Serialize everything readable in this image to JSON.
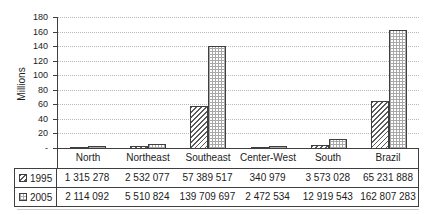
{
  "colors": {
    "background": "#ffffff",
    "axis_and_borders": "#3f3f3f",
    "text": "#1c1c1c",
    "gridline": "#b9b9b9",
    "hatch_pattern_1995": "#5a5a5a",
    "grid_pattern_2005": "#a8a8a8",
    "table_shadow": "#cccccc"
  },
  "chart_data": {
    "type": "bar",
    "title": "",
    "xlabel": "",
    "ylabel": "Millions",
    "categories": [
      "North",
      "Northeast",
      "Southeast",
      "Center-West",
      "South",
      "Brazil"
    ],
    "series": [
      {
        "name": "1995",
        "pattern": "diagonal-hatch",
        "values": [
          1315278,
          2532077,
          57389517,
          340979,
          3573028,
          65231888
        ],
        "value_labels": [
          "1 315 278",
          "2 532 077",
          "57 389 517",
          "340 979",
          "3 573 028",
          "65 231 888"
        ]
      },
      {
        "name": "2005",
        "pattern": "fine-grid",
        "values": [
          2114092,
          5510824,
          139709697,
          2472534,
          12919543,
          162807283
        ],
        "value_labels": [
          "2 114 092",
          "5 510 824",
          "139 709 697",
          "2 472 534",
          "12 919 543",
          "162 807 283"
        ]
      }
    ],
    "y_axis": {
      "min": 0,
      "max": 180000000,
      "step": 20000000,
      "tick_labels": [
        "180",
        "160",
        "140",
        "120",
        "100",
        "80",
        "60",
        "40",
        "20",
        "-"
      ]
    },
    "grid": "dotted-horizontal",
    "legend_position": "data-table-left-column"
  }
}
